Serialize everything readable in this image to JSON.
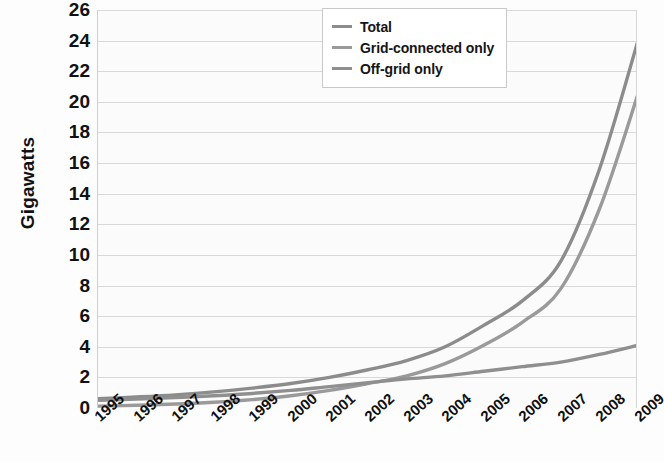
{
  "chart_data": {
    "type": "line",
    "title": "",
    "xlabel": "",
    "ylabel": "Gigawatts",
    "x": [
      "1995",
      "1996",
      "1997",
      "1998",
      "1999",
      "2000",
      "2001",
      "2002",
      "2003",
      "2004",
      "2005",
      "2006",
      "2007",
      "2008",
      "2009"
    ],
    "xlim": [
      "1995",
      "2009"
    ],
    "ylim": [
      0,
      26
    ],
    "ytick_labels": [
      "26",
      "24",
      "22",
      "20",
      "18",
      "16",
      "14",
      "12",
      "10",
      "8",
      "6",
      "4",
      "2",
      "0"
    ],
    "ytick_values": [
      26,
      24,
      22,
      20,
      18,
      16,
      14,
      12,
      10,
      8,
      6,
      4,
      2,
      0
    ],
    "grid": "horizontal",
    "legend_position": "top-right",
    "series": [
      {
        "name": "Total",
        "color": "#8c8c8c",
        "values": [
          0.6,
          0.72,
          0.86,
          1.05,
          1.3,
          1.6,
          2.0,
          2.5,
          3.1,
          4.0,
          5.4,
          7.0,
          9.6,
          15.6,
          24.0
        ]
      },
      {
        "name": "Grid-connected only",
        "color": "#9a9a9a",
        "values": [
          0.12,
          0.18,
          0.26,
          0.38,
          0.55,
          0.8,
          1.15,
          1.6,
          2.1,
          2.9,
          4.1,
          5.6,
          7.8,
          13.0,
          20.5
        ]
      },
      {
        "name": "Off-grid only",
        "color": "#8f8f8f",
        "values": [
          0.5,
          0.58,
          0.68,
          0.8,
          0.95,
          1.15,
          1.4,
          1.65,
          1.9,
          2.1,
          2.4,
          2.7,
          3.0,
          3.5,
          4.1
        ]
      }
    ]
  },
  "legend": {
    "items": [
      {
        "label": "Total"
      },
      {
        "label": "Grid-connected only"
      },
      {
        "label": "Off-grid only"
      }
    ]
  },
  "axes": {
    "y_title": "Gigawatts"
  }
}
